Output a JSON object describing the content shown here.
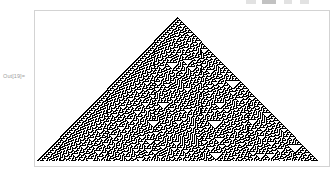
{
  "application": {
    "name": "Mathematica Notebook",
    "cell_type": "output"
  },
  "toolbar": {
    "visible_fragment": true,
    "note": "partially cropped toolbar row at top edge",
    "fragments": [
      {
        "name": "toolbar-fragment-1",
        "left": 246,
        "width": 10,
        "tone": "light"
      },
      {
        "name": "toolbar-fragment-2",
        "left": 262,
        "width": 14,
        "tone": "dark"
      },
      {
        "name": "toolbar-fragment-3",
        "left": 284,
        "width": 8,
        "tone": "light"
      },
      {
        "name": "toolbar-fragment-4",
        "left": 300,
        "width": 9,
        "tone": "light"
      }
    ]
  },
  "output_cell": {
    "label": "Out[19]=",
    "label_color": "#9d9d9d"
  },
  "graphics": {
    "frame": {
      "border_color": "#d3d3d3",
      "background": "#ffffff",
      "x": 34,
      "y": 10,
      "width": 296,
      "height": 157
    },
    "title": "",
    "description": "Elementary cellular automaton Rule 30 evolution from a single black cell, rendered as a dense pseudorandom triangle with apex at top center."
  },
  "chart_data": {
    "type": "heatmap",
    "title": "",
    "subtitle": "",
    "xlabel": "",
    "ylabel": "",
    "grid": false,
    "legend_position": "none",
    "automaton": {
      "rule": 30,
      "rule_binary": "00011110",
      "neighborhood_size": 3,
      "states": 2,
      "initial_condition": "single black cell at center",
      "steps": 144,
      "width_cells": 289,
      "cell_size_px": 1
    },
    "colors": {
      "on": "#000000",
      "off": "#ffffff"
    },
    "geometry": {
      "apex_x": 177,
      "apex_y": 17,
      "base_left_x": 40,
      "base_right_x": 318,
      "base_y": 161
    },
    "axis_ranges": {
      "x": [
        0,
        289
      ],
      "y": [
        0,
        144
      ]
    },
    "features": [
      "self-similar inverted white triangles of varying size scattered through the interior",
      "left side shows regular periodic striping typical of Rule 30",
      "right side is aperiodic / pseudorandom",
      "overall silhouette is an isoceles triangle expanding one cell per step on each side"
    ]
  }
}
